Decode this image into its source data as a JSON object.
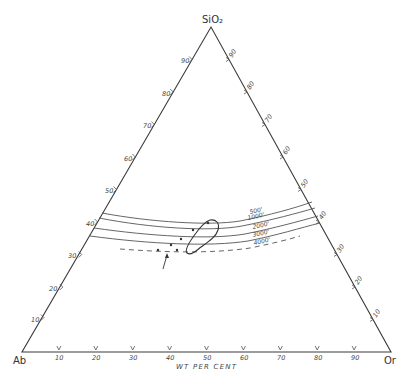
{
  "diagram": {
    "type": "ternary",
    "vertices": {
      "top": "SiO₂",
      "left": "Ab",
      "right": "Or"
    },
    "axis_title": "WT PER CENT",
    "ticks": {
      "base": [
        "10",
        "20",
        "30",
        "40",
        "50",
        "60",
        "70",
        "80",
        "90"
      ],
      "left_edge": [
        "10",
        "20",
        "30",
        "40",
        "50",
        "60",
        "70",
        "80",
        "90"
      ],
      "right_edge": [
        "10",
        "20",
        "30",
        "40",
        "50",
        "60",
        "70",
        "80",
        "90"
      ]
    },
    "isobars": [
      {
        "label": "500'",
        "style": "solid"
      },
      {
        "label": "1000'",
        "style": "solid"
      },
      {
        "label": "2000'",
        "style": "solid"
      },
      {
        "label": "3000'",
        "style": "solid"
      },
      {
        "label": "4000'",
        "style": "dashed"
      }
    ],
    "colors": {
      "line": "#3a3a3a",
      "background": "#ffffff"
    }
  }
}
